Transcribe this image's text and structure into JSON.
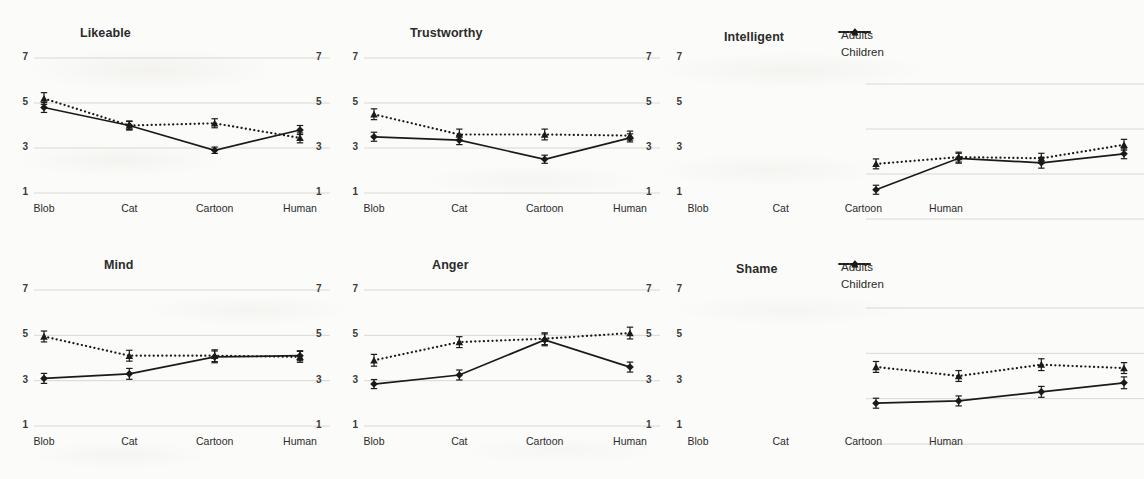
{
  "figure": {
    "series_labels": {
      "adults": "Adults",
      "children": "Children"
    },
    "y_ticks": [
      "7",
      "5",
      "3",
      "1"
    ],
    "x_categories": [
      "Blob",
      "Cat",
      "Cartoon",
      "Human"
    ],
    "colors": {
      "line": "#1a1a1a",
      "grid": "#d8d8d4",
      "text": "#2b2b2b",
      "background": "#fbfbf9"
    }
  },
  "chart_data": [
    {
      "type": "line",
      "title": "Likeable",
      "xlabel": "",
      "ylabel": "",
      "categories": [
        "Blob",
        "Cat",
        "Cartoon",
        "Human"
      ],
      "ylim": [
        1,
        7
      ],
      "yticks": [
        1,
        3,
        5,
        7
      ],
      "grid": true,
      "legend": false,
      "series": [
        {
          "name": "Adults",
          "marker": "diamond",
          "linestyle": "solid",
          "values": [
            4.8,
            4.0,
            2.9,
            3.8
          ],
          "errors": [
            0.22,
            0.18,
            0.14,
            0.2
          ]
        },
        {
          "name": "Children",
          "marker": "triangle",
          "linestyle": "dotted",
          "values": [
            5.2,
            4.0,
            4.1,
            3.45
          ],
          "errors": [
            0.26,
            0.2,
            0.2,
            0.22
          ]
        }
      ]
    },
    {
      "type": "line",
      "title": "Trustworthy",
      "xlabel": "",
      "ylabel": "",
      "categories": [
        "Blob",
        "Cat",
        "Cartoon",
        "Human"
      ],
      "ylim": [
        1,
        7
      ],
      "yticks": [
        1,
        3,
        5,
        7
      ],
      "grid": true,
      "legend": false,
      "series": [
        {
          "name": "Adults",
          "marker": "diamond",
          "linestyle": "solid",
          "values": [
            3.5,
            3.35,
            2.5,
            3.45
          ],
          "errors": [
            0.2,
            0.2,
            0.18,
            0.18
          ]
        },
        {
          "name": "Children",
          "marker": "triangle",
          "linestyle": "dotted",
          "values": [
            4.5,
            3.6,
            3.6,
            3.55
          ],
          "errors": [
            0.24,
            0.24,
            0.24,
            0.2
          ]
        }
      ]
    },
    {
      "type": "line",
      "title": "Intelligent",
      "xlabel": "",
      "ylabel": "",
      "categories": [
        "Blob",
        "Cat",
        "Cartoon",
        "Human"
      ],
      "ylim": [
        1,
        7
      ],
      "yticks": [
        1,
        3,
        5,
        7
      ],
      "grid": true,
      "legend": true,
      "legend_position": "top-right",
      "series": [
        {
          "name": "Adults",
          "marker": "diamond",
          "linestyle": "solid",
          "values": [
            2.3,
            3.7,
            3.5,
            3.9
          ],
          "errors": [
            0.2,
            0.22,
            0.24,
            0.22
          ]
        },
        {
          "name": "Children",
          "marker": "triangle",
          "linestyle": "dotted",
          "values": [
            3.45,
            3.75,
            3.7,
            4.3
          ],
          "errors": [
            0.22,
            0.22,
            0.22,
            0.24
          ]
        }
      ]
    },
    {
      "type": "line",
      "title": "Mind",
      "xlabel": "",
      "ylabel": "",
      "categories": [
        "Blob",
        "Cat",
        "Cartoon",
        "Human"
      ],
      "ylim": [
        1,
        7
      ],
      "yticks": [
        1,
        3,
        5,
        7
      ],
      "grid": true,
      "legend": false,
      "series": [
        {
          "name": "Adults",
          "marker": "diamond",
          "linestyle": "solid",
          "values": [
            3.1,
            3.3,
            4.05,
            4.1
          ],
          "errors": [
            0.22,
            0.24,
            0.26,
            0.22
          ]
        },
        {
          "name": "Children",
          "marker": "triangle",
          "linestyle": "dotted",
          "values": [
            4.95,
            4.1,
            4.1,
            4.05
          ],
          "errors": [
            0.24,
            0.24,
            0.26,
            0.24
          ]
        }
      ]
    },
    {
      "type": "line",
      "title": "Anger",
      "xlabel": "",
      "ylabel": "",
      "categories": [
        "Blob",
        "Cat",
        "Cartoon",
        "Human"
      ],
      "ylim": [
        1,
        7
      ],
      "yticks": [
        1,
        3,
        5,
        7
      ],
      "grid": true,
      "legend": false,
      "series": [
        {
          "name": "Adults",
          "marker": "diamond",
          "linestyle": "solid",
          "values": [
            2.85,
            3.25,
            4.8,
            3.6
          ],
          "errors": [
            0.2,
            0.22,
            0.26,
            0.22
          ]
        },
        {
          "name": "Children",
          "marker": "triangle",
          "linestyle": "dotted",
          "values": [
            3.9,
            4.7,
            4.85,
            5.1
          ],
          "errors": [
            0.26,
            0.24,
            0.26,
            0.26
          ]
        }
      ]
    },
    {
      "type": "line",
      "title": "Shame",
      "xlabel": "",
      "ylabel": "",
      "categories": [
        "Blob",
        "Cat",
        "Cartoon",
        "Human"
      ],
      "ylim": [
        1,
        7
      ],
      "yticks": [
        1,
        3,
        5,
        7
      ],
      "grid": true,
      "legend": true,
      "legend_position": "top-right",
      "series": [
        {
          "name": "Adults",
          "marker": "diamond",
          "linestyle": "solid",
          "values": [
            2.8,
            2.9,
            3.3,
            3.7
          ],
          "errors": [
            0.22,
            0.22,
            0.24,
            0.26
          ]
        },
        {
          "name": "Children",
          "marker": "triangle",
          "linestyle": "dotted",
          "values": [
            4.4,
            4.0,
            4.5,
            4.35
          ],
          "errors": [
            0.24,
            0.24,
            0.26,
            0.24
          ]
        }
      ]
    }
  ]
}
